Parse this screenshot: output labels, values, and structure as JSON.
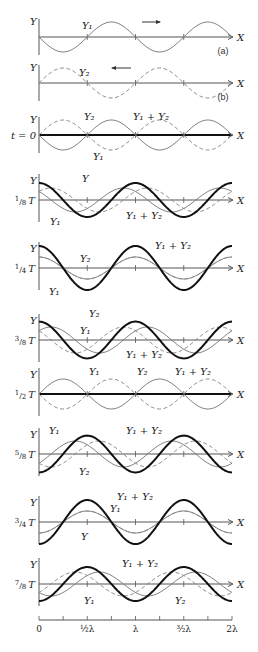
{
  "figure": {
    "width": 258,
    "height": 652,
    "x0": 39,
    "lambda_px": 96.5,
    "axis_end": 232,
    "colors": {
      "axis": "#555555",
      "y1": "#777777",
      "y2": "#888888",
      "sum": "#111111",
      "text": "#222222"
    }
  },
  "labels": {
    "y_axis": "Y",
    "x_axis": "X",
    "y1": "Y₁",
    "y2": "Y₂",
    "sum": "Y₁ + Y₂",
    "y": "Y"
  },
  "panels": [
    {
      "id": "a",
      "axis_y": 37,
      "amp": 15,
      "t_frac": 0,
      "show": [
        "y1"
      ],
      "tag": "(a)",
      "time_label": "",
      "arrow": "right",
      "callouts": [
        {
          "text": "Y₁",
          "x": 82,
          "y": 29
        }
      ]
    },
    {
      "id": "b",
      "axis_y": 83,
      "amp": 15,
      "t_frac": 0,
      "show": [
        "y2"
      ],
      "tag": "(b)",
      "time_label": "",
      "arrow": "left",
      "callouts": [
        {
          "text": "Y₂",
          "x": 79,
          "y": 76
        }
      ]
    },
    {
      "id": "t0",
      "axis_y": 135,
      "amp": 15,
      "t_frac": 0,
      "show": [
        "y1",
        "y2",
        "sum"
      ],
      "tag": "",
      "time_label": "t = 0",
      "arrow": "",
      "callouts": [
        {
          "text": "Y₂",
          "x": 84,
          "y": 120
        },
        {
          "text": "Y₁ + Y₂",
          "x": 133,
          "y": 120
        },
        {
          "text": "Y₁",
          "x": 93,
          "y": 160
        }
      ]
    },
    {
      "id": "t18",
      "axis_y": 200,
      "amp": 12,
      "t_frac": 0.125,
      "show": [
        "y1",
        "y2",
        "sum"
      ],
      "tag": "",
      "time_label": "1/8 T",
      "arrow": "",
      "callouts": [
        {
          "text": "Y",
          "x": 82,
          "y": 182
        },
        {
          "text": "Y₁",
          "x": 50,
          "y": 225
        },
        {
          "text": "Y₁ + Y₂",
          "x": 126,
          "y": 219
        }
      ]
    },
    {
      "id": "t14",
      "axis_y": 268,
      "amp": 11,
      "t_frac": 0.25,
      "show": [
        "y1",
        "y2",
        "sum"
      ],
      "tag": "",
      "time_label": "1/4 T",
      "arrow": "",
      "callouts": [
        {
          "text": "Y₂",
          "x": 80,
          "y": 262
        },
        {
          "text": "Y₁",
          "x": 49,
          "y": 295
        },
        {
          "text": "Y₁ + Y₂",
          "x": 155,
          "y": 249
        }
      ]
    },
    {
      "id": "t38",
      "axis_y": 340,
      "amp": 13,
      "t_frac": 0.375,
      "show": [
        "y1",
        "y2",
        "sum"
      ],
      "tag": "",
      "time_label": "3/8 T",
      "arrow": "",
      "callouts": [
        {
          "text": "Y₂",
          "x": 89,
          "y": 317
        },
        {
          "text": "Y₁",
          "x": 80,
          "y": 334
        },
        {
          "text": "Y₁ + Y₂",
          "x": 126,
          "y": 358
        }
      ]
    },
    {
      "id": "t12",
      "axis_y": 394,
      "amp": 15,
      "t_frac": 0.5,
      "show": [
        "y1",
        "y2",
        "sum"
      ],
      "tag": "",
      "time_label": "1/2 T",
      "arrow": "",
      "callouts": [
        {
          "text": "Y₁",
          "x": 89,
          "y": 375
        },
        {
          "text": "Y₂",
          "x": 137,
          "y": 375
        },
        {
          "text": "Y₁ + Y₂",
          "x": 175,
          "y": 375
        }
      ]
    },
    {
      "id": "t58",
      "axis_y": 454,
      "amp": 13,
      "t_frac": 0.625,
      "show": [
        "y1",
        "y2",
        "sum"
      ],
      "tag": "",
      "time_label": "5/8 T",
      "arrow": "",
      "callouts": [
        {
          "text": "Y₁",
          "x": 49,
          "y": 434
        },
        {
          "text": "Y₁ + Y₂",
          "x": 126,
          "y": 434
        },
        {
          "text": "Y₂",
          "x": 79,
          "y": 475
        }
      ]
    },
    {
      "id": "t34",
      "axis_y": 522,
      "amp": 11,
      "t_frac": 0.75,
      "show": [
        "y1",
        "y2",
        "sum"
      ],
      "tag": "",
      "time_label": "3/4 T",
      "arrow": "",
      "callouts": [
        {
          "text": "Y₁ + Y₂",
          "x": 117,
          "y": 500
        },
        {
          "text": "Y₁",
          "x": 110,
          "y": 512
        },
        {
          "text": "Y",
          "x": 81,
          "y": 540
        }
      ]
    },
    {
      "id": "t78",
      "axis_y": 584,
      "amp": 12,
      "t_frac": 0.875,
      "show": [
        "y1",
        "y2",
        "sum"
      ],
      "tag": "",
      "time_label": "7/8 T",
      "arrow": "",
      "callouts": [
        {
          "text": "Y₁ + Y₂",
          "x": 122,
          "y": 567
        },
        {
          "text": "Y₁",
          "x": 84,
          "y": 604
        },
        {
          "text": "Y₂",
          "x": 175,
          "y": 604
        }
      ]
    }
  ],
  "time_labels": [
    {
      "num": "1",
      "den": "8",
      "suffix": "T"
    },
    {
      "num": "1",
      "den": "4",
      "suffix": "T"
    },
    {
      "num": "3",
      "den": "8",
      "suffix": "T"
    },
    {
      "num": "1",
      "den": "2",
      "suffix": "T"
    },
    {
      "num": "5",
      "den": "8",
      "suffix": "T"
    },
    {
      "num": "3",
      "den": "4",
      "suffix": "T"
    },
    {
      "num": "7",
      "den": "8",
      "suffix": "T"
    }
  ],
  "scale": {
    "y": 620,
    "ticks": 8,
    "labels": [
      {
        "text": "0",
        "at": 0
      },
      {
        "text": "½λ",
        "at": 0.5
      },
      {
        "text": "λ",
        "at": 1
      },
      {
        "text": "³⁄₂λ",
        "at": 1.5
      },
      {
        "text": "2λ",
        "at": 2
      }
    ]
  }
}
